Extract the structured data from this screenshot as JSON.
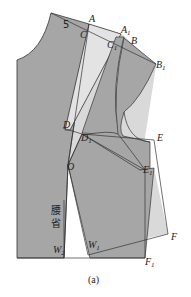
{
  "diagram": {
    "number_label": "5",
    "dart_label_line1": "腰",
    "dart_label_line2": "省",
    "caption": "(a)",
    "colors": {
      "fill_dark": "#a6a6a6",
      "fill_light": "#d9d9d9",
      "stroke": "#333333",
      "background": "#ffffff"
    },
    "points": [
      {
        "id": "A",
        "label": "A",
        "sub": "",
        "x": 89,
        "y": 22
      },
      {
        "id": "C",
        "label": "C",
        "sub": "",
        "x": 80,
        "y": 38
      },
      {
        "id": "A1",
        "label": "A",
        "sub": "1",
        "x": 121,
        "y": 33
      },
      {
        "id": "B",
        "label": "B",
        "sub": "",
        "x": 131,
        "y": 44
      },
      {
        "id": "C1",
        "label": "C",
        "sub": "1",
        "x": 107,
        "y": 48
      },
      {
        "id": "B1",
        "label": "B",
        "sub": "1",
        "x": 156,
        "y": 68
      },
      {
        "id": "D",
        "label": "D",
        "sub": "",
        "x": 63,
        "y": 128
      },
      {
        "id": "D1",
        "label": "D",
        "sub": "1",
        "x": 81,
        "y": 141
      },
      {
        "id": "E",
        "label": "E",
        "sub": "",
        "x": 157,
        "y": 141
      },
      {
        "id": "O",
        "label": "O",
        "sub": "",
        "x": 67,
        "y": 170
      },
      {
        "id": "E1",
        "label": "E",
        "sub": "1",
        "x": 143,
        "y": 173
      },
      {
        "id": "W2",
        "label": "W",
        "sub": "2",
        "x": 53,
        "y": 253
      },
      {
        "id": "W1",
        "label": "W",
        "sub": "1",
        "x": 88,
        "y": 248
      },
      {
        "id": "F",
        "label": "F",
        "sub": "",
        "x": 171,
        "y": 240
      },
      {
        "id": "F1",
        "label": "F",
        "sub": "1",
        "x": 145,
        "y": 265
      }
    ]
  }
}
